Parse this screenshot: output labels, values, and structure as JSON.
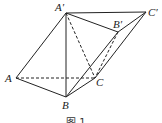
{
  "figure": {
    "caption": "图 1",
    "vertices": {
      "A_prime": {
        "label": "A′",
        "x": 66,
        "y": 13
      },
      "B_prime": {
        "label": "B′",
        "x": 118,
        "y": 32
      },
      "C_prime": {
        "label": "C′",
        "x": 146,
        "y": 12
      },
      "A": {
        "label": "A",
        "x": 16,
        "y": 78
      },
      "B": {
        "label": "B",
        "x": 66,
        "y": 97
      },
      "C": {
        "label": "C",
        "x": 95,
        "y": 78
      }
    },
    "solid_edges": [
      [
        "A_prime",
        "C_prime"
      ],
      [
        "A_prime",
        "B_prime"
      ],
      [
        "B_prime",
        "C_prime"
      ],
      [
        "A_prime",
        "A"
      ],
      [
        "A_prime",
        "B"
      ],
      [
        "A",
        "B"
      ],
      [
        "B",
        "C"
      ],
      [
        "B",
        "B_prime"
      ],
      [
        "C",
        "C_prime"
      ]
    ],
    "dashed_edges": [
      [
        "A",
        "C"
      ],
      [
        "A_prime",
        "C"
      ],
      [
        "B_prime",
        "C"
      ]
    ],
    "stroke_color": "#222222"
  }
}
